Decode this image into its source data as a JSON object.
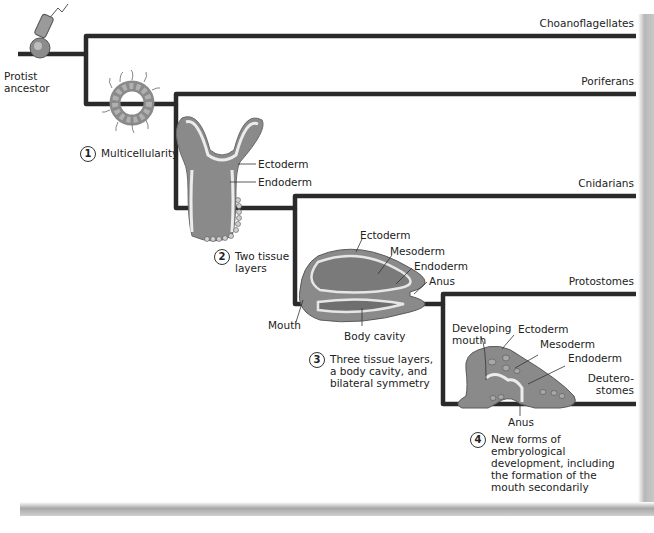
{
  "diagram": {
    "root_label": "Protist\nancestor",
    "taxa": [
      {
        "name": "Choanoflagellates"
      },
      {
        "name": "Poriferans"
      },
      {
        "name": "Cnidarians"
      },
      {
        "name": "Protostomes"
      },
      {
        "name": "Deutero-\nstomes"
      }
    ],
    "innovations": [
      {
        "number": "1",
        "text": "Multicellularity"
      },
      {
        "number": "2",
        "text": "Two tissue\nlayers"
      },
      {
        "number": "3",
        "text": "Three tissue layers,\na body cavity, and\nbilateral symmetry"
      },
      {
        "number": "4",
        "text": "New forms of\nembryological\ndevelopment, including\nthe formation of the\nmouth secondarily"
      }
    ],
    "cnidarian_labels": {
      "ectoderm": "Ectoderm",
      "endoderm": "Endoderm"
    },
    "protostome_labels": {
      "ectoderm": "Ectoderm",
      "mesoderm": "Mesoderm",
      "endoderm": "Endoderm",
      "anus": "Anus",
      "mouth": "Mouth",
      "body_cavity": "Body cavity"
    },
    "deuterostome_labels": {
      "developing_mouth": "Developing\nmouth",
      "ectoderm": "Ectoderm",
      "mesoderm": "Mesoderm",
      "endoderm": "Endoderm",
      "anus": "Anus"
    },
    "colors": {
      "line": "#2a2a2a",
      "tissue_outer": "#8a8a8a",
      "tissue_light": "#e6e6e6",
      "tissue_inner": "#7d7d7d"
    }
  }
}
